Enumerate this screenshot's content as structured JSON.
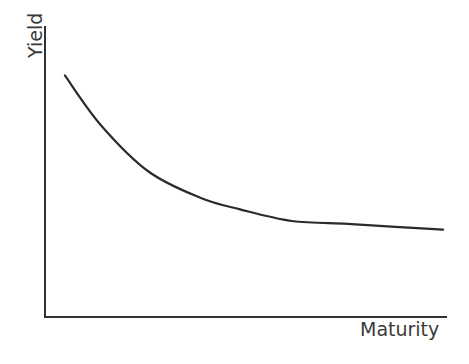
{
  "chart_data": {
    "type": "line",
    "title": "",
    "xlabel": "Maturity",
    "ylabel": "Yield",
    "grid": false,
    "legend": null,
    "ticks": false,
    "series": [
      {
        "name": "Yield curve",
        "color": "#2b2b2b",
        "x": [
          0.05,
          0.14,
          0.26,
          0.39,
          0.49,
          0.62,
          0.76,
          0.88,
          1.0
        ],
        "y": [
          0.83,
          0.66,
          0.5,
          0.41,
          0.37,
          0.33,
          0.32,
          0.31,
          0.3
        ]
      }
    ],
    "xlim": [
      0,
      1
    ],
    "ylim": [
      0,
      1
    ]
  },
  "axes": {
    "color": "#333333"
  }
}
